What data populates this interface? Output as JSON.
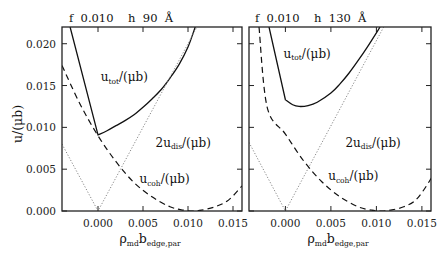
{
  "figure": {
    "ylabel": "u/(μb)",
    "xlabel_main": "ρ",
    "xlabel_sub1": "md",
    "xlabel_mid": "b",
    "xlabel_sub2": "edge,par"
  },
  "chart_data": [
    {
      "type": "line",
      "panel": "left",
      "title": "f 0.010   h 90 Å",
      "header": {
        "f_label": "f",
        "f_value": "0.010",
        "h_label": "h",
        "h_value": "90",
        "h_unit": "Å"
      },
      "xlabel": "ρ_md b_edge,par",
      "ylabel": "u/(μb)",
      "xlim": [
        -0.004,
        0.016
      ],
      "ylim": [
        0.0,
        0.022
      ],
      "xticks": [
        "0.000",
        "0.005",
        "0.010",
        "0.015"
      ],
      "xtick_values": [
        0.0,
        0.005,
        0.01,
        0.015
      ],
      "yticks": [
        "0.000",
        "0.005",
        "0.010",
        "0.015",
        "0.020"
      ],
      "ytick_values": [
        0.0,
        0.005,
        0.01,
        0.015,
        0.02
      ],
      "grid": false,
      "series": [
        {
          "name": "u_tot/(μb)",
          "style": "solid",
          "x": [
            -0.0031,
            0.0,
            0.001,
            0.002,
            0.003,
            0.004,
            0.005,
            0.006,
            0.007,
            0.008,
            0.009,
            0.01,
            0.0108
          ],
          "y": [
            0.022,
            0.0091,
            0.0096,
            0.0102,
            0.0108,
            0.0115,
            0.0124,
            0.0134,
            0.0145,
            0.0159,
            0.0175,
            0.0196,
            0.022
          ]
        },
        {
          "name": "2u_dis/(μb)",
          "style": "dotted",
          "x": [
            -0.004,
            0.0,
            0.011
          ],
          "y": [
            0.008,
            0.0,
            0.022
          ]
        },
        {
          "name": "u_coh/(μb)",
          "style": "dashed",
          "x": [
            -0.004,
            -0.002,
            0.0,
            0.002,
            0.004,
            0.006,
            0.008,
            0.0095,
            0.0105,
            0.0115,
            0.013,
            0.0145,
            0.016
          ],
          "y": [
            0.0174,
            0.0128,
            0.009,
            0.0059,
            0.0034,
            0.0017,
            0.0005,
            0.0001,
            0.0,
            0.0001,
            0.0005,
            0.0013,
            0.003
          ]
        }
      ],
      "annotations": [
        {
          "text": "u_tot/(μb)",
          "x": 0.0003,
          "y": 0.0155
        },
        {
          "text": "2u_dis/(μb)",
          "x": 0.0064,
          "y": 0.0077
        },
        {
          "text": "u_coh/(μb)",
          "x": 0.0046,
          "y": 0.0033
        }
      ]
    },
    {
      "type": "line",
      "panel": "right",
      "title": "f 0.010   h 130 Å",
      "header": {
        "f_label": "f",
        "f_value": "0.010",
        "h_label": "h",
        "h_value": "130",
        "h_unit": "Å"
      },
      "xlabel": "ρ_md b_edge,par",
      "ylabel": "",
      "xlim": [
        -0.004,
        0.016
      ],
      "ylim": [
        0.0,
        0.022
      ],
      "xticks": [
        "0.000",
        "0.005",
        "0.010",
        "0.015"
      ],
      "xtick_values": [
        0.0,
        0.005,
        0.01,
        0.015
      ],
      "yticks": [],
      "ytick_values": [
        0.0,
        0.005,
        0.01,
        0.015,
        0.02
      ],
      "grid": false,
      "series": [
        {
          "name": "u_tot/(μb)",
          "style": "solid",
          "x": [
            -0.0018,
            0.0,
            0.0008,
            0.0015,
            0.0025,
            0.0035,
            0.005,
            0.006,
            0.007,
            0.008,
            0.009,
            0.0104
          ],
          "y": [
            0.022,
            0.0133,
            0.0127,
            0.0125,
            0.0126,
            0.013,
            0.0141,
            0.0152,
            0.0165,
            0.018,
            0.0196,
            0.022
          ]
        },
        {
          "name": "2u_dis/(μb)",
          "style": "dotted",
          "x": [
            -0.004,
            0.0,
            0.0108
          ],
          "y": [
            0.0082,
            0.0,
            0.022
          ]
        },
        {
          "name": "u_coh/(μb)",
          "style": "dashed",
          "x": [
            -0.0029,
            -0.002,
            0.0,
            0.002,
            0.004,
            0.006,
            0.008,
            0.0095,
            0.0105,
            0.0115,
            0.013,
            0.0145,
            0.0162
          ],
          "y": [
            0.022,
            0.0124,
            0.0092,
            0.006,
            0.0035,
            0.0017,
            0.0005,
            0.0001,
            0.0,
            0.0001,
            0.0005,
            0.0015,
            0.0042
          ]
        }
      ],
      "annotations": [
        {
          "text": "u_tot/(μb)",
          "x": -0.0002,
          "y": 0.0183
        },
        {
          "text": "2u_dis/(μb)",
          "x": 0.0066,
          "y": 0.0077
        },
        {
          "text": "u_coh/(μb)",
          "x": 0.0047,
          "y": 0.0037
        }
      ]
    }
  ],
  "labels": {
    "utot_main": "u",
    "utot_sub": "tot",
    "utot_rest": "/(μb)",
    "udis_pre": "2u",
    "udis_sub": "dis",
    "udis_rest": "/(μb)",
    "ucoh_main": "u",
    "ucoh_sub": "coh",
    "ucoh_rest": "/(μb)"
  }
}
